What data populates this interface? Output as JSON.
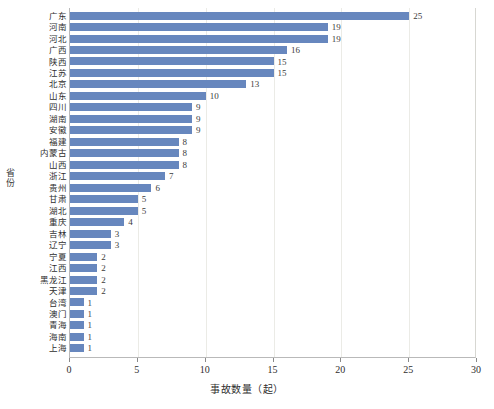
{
  "chart_data": {
    "type": "bar",
    "orientation": "horizontal",
    "title": "",
    "xlabel": "事故数量（起）",
    "ylabel": "省份",
    "xlim": [
      0,
      30
    ],
    "xticks": [
      0,
      5,
      10,
      15,
      20,
      25,
      30
    ],
    "grid": true,
    "legend": null,
    "bar_color": "#6787be",
    "categories": [
      "广东",
      "河南",
      "河北",
      "广西",
      "陕西",
      "江苏",
      "北京",
      "山东",
      "四川",
      "湖南",
      "安徽",
      "福建",
      "内蒙古",
      "山西",
      "浙江",
      "贵州",
      "甘肃",
      "湖北",
      "重庆",
      "吉林",
      "辽宁",
      "宁夏",
      "江西",
      "黑龙江",
      "天津",
      "台湾",
      "澳门",
      "青海",
      "海南",
      "上海"
    ],
    "values": [
      25,
      19,
      19,
      16,
      15,
      15,
      13,
      10,
      9,
      9,
      9,
      8,
      8,
      8,
      7,
      6,
      5,
      5,
      4,
      3,
      3,
      2,
      2,
      2,
      2,
      1,
      1,
      1,
      1,
      1
    ],
    "value_labels": [
      "25",
      "19",
      "19",
      "16",
      "15",
      "15",
      "13",
      "10",
      "9",
      "9",
      "9",
      "8",
      "8",
      "8",
      "7",
      "6",
      "5",
      "5",
      "4",
      "3",
      "3",
      "2",
      "2",
      "2",
      "2",
      "1",
      "1",
      "1",
      "1",
      "1"
    ]
  }
}
